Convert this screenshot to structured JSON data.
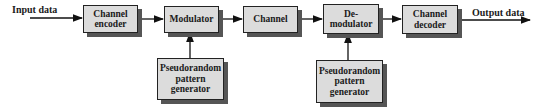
{
  "diagram": {
    "input_label": "Input data",
    "output_label": "Output data",
    "blocks": {
      "channel_encoder": "Channel encoder",
      "modulator": "Modulator",
      "channel": "Channel",
      "demodulator": "De- modulator",
      "channel_decoder": "Channel decoder",
      "pn_generator_tx": "Pseudorandom pattern generator",
      "pn_generator_rx": "Pseudorandom pattern generator"
    },
    "colors": {
      "box_fill": "#dcdcdc",
      "box_border": "#222222",
      "shadow": "#555555",
      "line": "#111111"
    }
  }
}
